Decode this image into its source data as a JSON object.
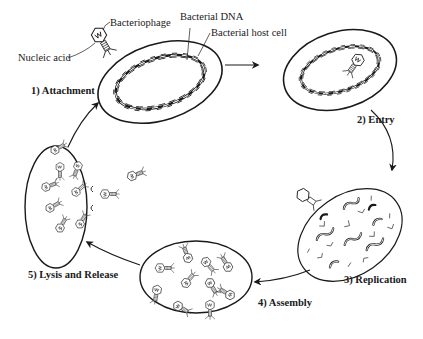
{
  "labels": {
    "bacteriophage": "Bacteriophage",
    "nucleic_acid": "Nucleic acid",
    "bacterial_dna": "Bacterial DNA",
    "bacterial_host_cell": "Bacterial host cell"
  },
  "steps": [
    {
      "id": 1,
      "label": "1) Attachment"
    },
    {
      "id": 2,
      "label": "2) Entry"
    },
    {
      "id": 3,
      "label": "3) Replication"
    },
    {
      "id": 4,
      "label": "4) Assembly"
    },
    {
      "id": 5,
      "label": "5) Lysis and Release"
    }
  ],
  "colors": {
    "stroke": "#1a1a1a",
    "background": "#ffffff"
  }
}
